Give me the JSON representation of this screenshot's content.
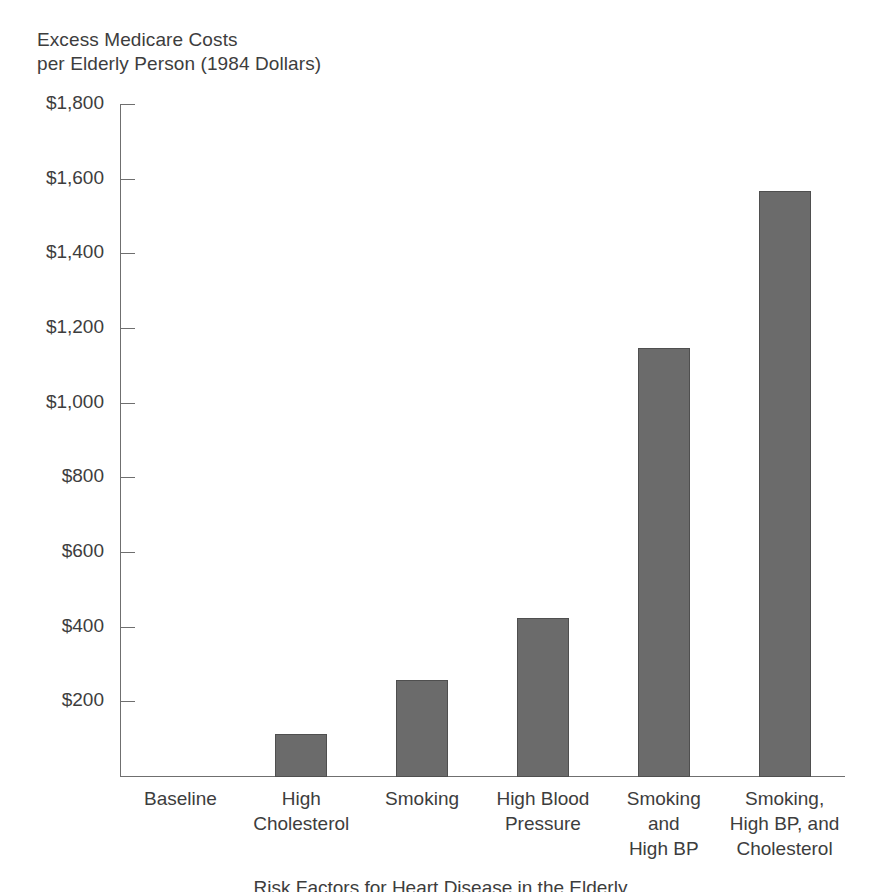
{
  "chart_data": {
    "type": "bar",
    "title": "Excess Medicare Costs\nper Elderly Person (1984 Dollars)",
    "ylabel": "Excess Medicare Costs per Elderly Person (1984 Dollars)",
    "xlabel": "Risk Factors for Heart Disease in the Elderly",
    "categories": [
      "Baseline",
      "High\nCholesterol",
      "Smoking",
      "High Blood\nPressure",
      "Smoking\nand\nHigh BP",
      "Smoking,\nHigh BP, and\nCholesterol"
    ],
    "values": [
      0,
      115,
      260,
      425,
      1150,
      1570
    ],
    "ylim": [
      0,
      1800
    ],
    "ytick_values": [
      1800,
      1600,
      1400,
      1200,
      1000,
      800,
      600,
      400,
      200
    ],
    "ytick_labels": [
      "$1,800",
      "$1,600",
      "$1,400",
      "$1,200",
      "$1,000",
      "$800",
      "$600",
      "$400",
      "$200"
    ],
    "grid": false,
    "legend": false,
    "bar_color": "#6b6b6b",
    "bar_edge_color": "#4f4f4f",
    "axis_color": "#6f6f6f",
    "text_color": "#3d3d3d"
  }
}
